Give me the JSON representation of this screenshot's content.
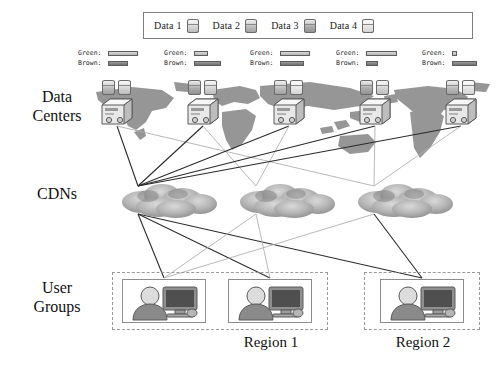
{
  "diagram": {
    "type": "three-tier-network-diagram"
  },
  "legend": {
    "items": [
      {
        "label": "Data 1",
        "icon": "database-cylinder-icon",
        "shade": "d1"
      },
      {
        "label": "Data 2",
        "icon": "database-cylinder-icon",
        "shade": "d2"
      },
      {
        "label": "Data 3",
        "icon": "database-cylinder-icon",
        "shade": "d3"
      },
      {
        "label": "Data 4",
        "icon": "database-cylinder-icon",
        "shade": "d4"
      }
    ]
  },
  "row_labels": {
    "data_centers": "Data\nCenters",
    "data_centers_line1": "Data",
    "data_centers_line2": "Centers",
    "cdns": "CDNs",
    "user_groups_line1": "User",
    "user_groups_line2": "Groups"
  },
  "stat_keys": {
    "green": "Green:",
    "brown": "Brown:"
  },
  "data_centers": [
    {
      "id": "dc1",
      "x": 100,
      "y": 80,
      "green_bar": 30,
      "brown_bar": 20,
      "databases": [
        "d2",
        "d1"
      ]
    },
    {
      "id": "dc2",
      "x": 186,
      "y": 80,
      "green_bar": 14,
      "brown_bar": 27,
      "databases": [
        "d3",
        "d1"
      ]
    },
    {
      "id": "dc3",
      "x": 272,
      "y": 80,
      "green_bar": 30,
      "brown_bar": 24,
      "databases": [
        "d2",
        "d4"
      ]
    },
    {
      "id": "dc4",
      "x": 358,
      "y": 80,
      "green_bar": 31,
      "brown_bar": 12,
      "databases": [
        "d3",
        "d1"
      ]
    },
    {
      "id": "dc5",
      "x": 444,
      "y": 80,
      "green_bar": 5,
      "brown_bar": 25,
      "databases": [
        "d2",
        "d4"
      ]
    }
  ],
  "stat_blocks": [
    {
      "x": 78,
      "y": 48,
      "green_bar": 30,
      "brown_bar": 20
    },
    {
      "x": 164,
      "y": 48,
      "green_bar": 14,
      "brown_bar": 27
    },
    {
      "x": 250,
      "y": 48,
      "green_bar": 30,
      "brown_bar": 24
    },
    {
      "x": 336,
      "y": 48,
      "green_bar": 31,
      "brown_bar": 12
    },
    {
      "x": 422,
      "y": 48,
      "green_bar": 5,
      "brown_bar": 25
    }
  ],
  "cdns": [
    {
      "id": "cdn1",
      "x": 118,
      "y": 180
    },
    {
      "id": "cdn2",
      "x": 236,
      "y": 180
    },
    {
      "id": "cdn3",
      "x": 354,
      "y": 180
    }
  ],
  "regions": [
    {
      "id": "region1",
      "label": "Region 1",
      "x": 112,
      "y": 272,
      "width": 216,
      "height": 58,
      "label_x": 168,
      "label_y": 334,
      "user_groups": [
        {
          "id": "ug1",
          "x": 122,
          "y": 279
        },
        {
          "id": "ug2",
          "x": 228,
          "y": 279
        }
      ]
    },
    {
      "id": "region2",
      "label": "Region 2",
      "x": 364,
      "y": 272,
      "width": 116,
      "height": 58,
      "label_x": 370,
      "label_y": 334,
      "user_groups": [
        {
          "id": "ug3",
          "x": 380,
          "y": 279
        }
      ]
    }
  ],
  "colors": {
    "green_bar": "#c4c4c4",
    "brown_bar": "#808080",
    "link_dark": "#2b2b2b",
    "link_light": "#b0b0b0",
    "map": "#6e6e6e",
    "text": "#111111",
    "region_border": "#9a9a9a"
  },
  "links_dc_to_cdn": [
    {
      "from": "dc1",
      "to": "cdn1",
      "tone": "dark"
    },
    {
      "from": "dc1",
      "to": "cdn3",
      "tone": "light"
    },
    {
      "from": "dc2",
      "to": "cdn1",
      "tone": "dark"
    },
    {
      "from": "dc2",
      "to": "cdn2",
      "tone": "light"
    },
    {
      "from": "dc3",
      "to": "cdn1",
      "tone": "dark"
    },
    {
      "from": "dc3",
      "to": "cdn2",
      "tone": "light"
    },
    {
      "from": "dc4",
      "to": "cdn1",
      "tone": "dark"
    },
    {
      "from": "dc4",
      "to": "cdn3",
      "tone": "light"
    },
    {
      "from": "dc5",
      "to": "cdn1",
      "tone": "dark"
    },
    {
      "from": "dc5",
      "to": "cdn3",
      "tone": "light"
    }
  ],
  "links_cdn_to_ug": [
    {
      "from": "cdn1",
      "to": "ug1",
      "tone": "dark"
    },
    {
      "from": "cdn1",
      "to": "ug2",
      "tone": "dark"
    },
    {
      "from": "cdn1",
      "to": "ug3",
      "tone": "dark"
    },
    {
      "from": "cdn2",
      "to": "ug1",
      "tone": "light"
    },
    {
      "from": "cdn2",
      "to": "ug2",
      "tone": "light"
    },
    {
      "from": "cdn3",
      "to": "ug1",
      "tone": "light"
    },
    {
      "from": "cdn3",
      "to": "ug3",
      "tone": "dark"
    }
  ]
}
